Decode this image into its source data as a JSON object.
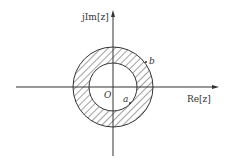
{
  "diagram": {
    "type": "complex-plane-annulus",
    "axes": {
      "x_label": "Re[z]",
      "y_label": "jIm[z]",
      "origin_label": "O"
    },
    "region": {
      "inner_radius_label": "a",
      "outer_radius_label": "b",
      "fill": "hatched annulus a < |z| < b"
    },
    "colors": {
      "stroke": "#333333",
      "background": "#ffffff"
    }
  }
}
